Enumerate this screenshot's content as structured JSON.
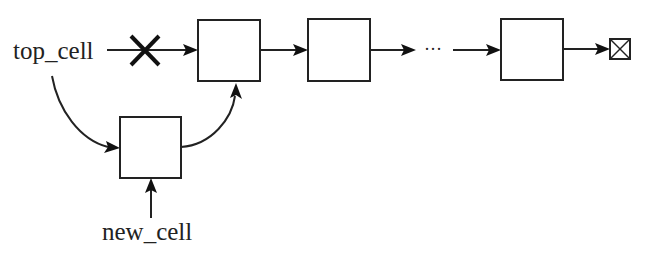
{
  "diagram": {
    "type": "linked-list-insertion",
    "labels": {
      "top_pointer": "top_cell",
      "new_pointer": "new_cell",
      "ellipsis": "···"
    },
    "nodes": [
      {
        "id": "node-1",
        "role": "original head"
      },
      {
        "id": "node-2",
        "role": "second node"
      },
      {
        "id": "node-n",
        "role": "last node"
      },
      {
        "id": "new-node",
        "role": "inserted node"
      },
      {
        "id": "null-terminator",
        "role": "null end marker"
      }
    ],
    "edges": [
      {
        "from": "top_cell",
        "to": "node-1",
        "status": "removed (crossed out)"
      },
      {
        "from": "top_cell",
        "to": "new-node",
        "status": "new link"
      },
      {
        "from": "new-node",
        "to": "node-1",
        "status": "new link"
      },
      {
        "from": "new_cell",
        "to": "new-node",
        "status": "pointer"
      },
      {
        "from": "node-1",
        "to": "node-2"
      },
      {
        "from": "node-2",
        "to": "ellipsis"
      },
      {
        "from": "ellipsis",
        "to": "node-n"
      },
      {
        "from": "node-n",
        "to": "null-terminator"
      }
    ],
    "colors": {
      "stroke": "#222222",
      "background": "#ffffff"
    }
  }
}
